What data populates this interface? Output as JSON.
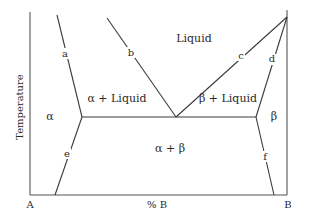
{
  "diagram": {
    "type": "binary eutectic phase diagram",
    "axes": {
      "y_label": "Temperature",
      "x_label": "% B",
      "left_end": "A",
      "right_end": "B"
    },
    "regions": {
      "liquid": "Liquid",
      "alpha_liquid": "α + Liquid",
      "beta_liquid": "β + Liquid",
      "alpha": "α",
      "beta": "β",
      "alpha_beta": "α + β"
    },
    "curve_labels": {
      "a": "a",
      "b": "b",
      "c": "c",
      "d": "d",
      "e": "e",
      "f": "f"
    }
  }
}
